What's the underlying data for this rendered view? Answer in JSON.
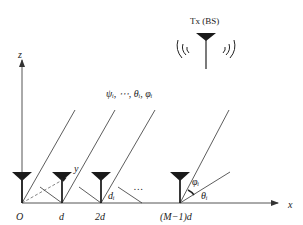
{
  "diagram": {
    "transmitter_label": "Tx (BS)",
    "axes": {
      "x_label": "x",
      "y_label": "y",
      "z_label": "z"
    },
    "origin_label": "O",
    "element_positions": [
      "O",
      "d",
      "2d",
      "(M−1)d"
    ],
    "ellipsis": "…",
    "ray_params_label": "ψᵢ, ⋯, θᵢ, φᵢ",
    "delay_label": "dᵢ",
    "angle_labels": {
      "elevation": "φᵢ",
      "azimuth": "θᵢ"
    },
    "colors": {
      "stroke": "#333333",
      "antenna": "#1a1a1a"
    }
  }
}
